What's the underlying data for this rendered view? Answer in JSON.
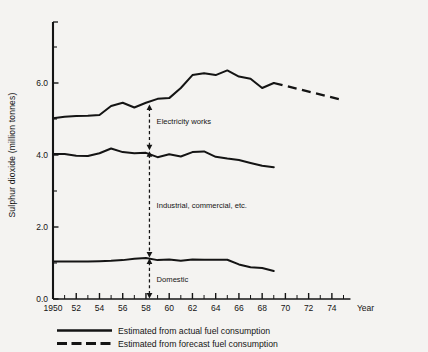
{
  "chart_data": {
    "type": "line",
    "title": "",
    "xlabel": "Year",
    "ylabel": "Sulphur dioxide (million tonnes)",
    "xlim": [
      1950,
      1975
    ],
    "ylim": [
      0.0,
      7.4
    ],
    "grid": false,
    "legend_position": "below-plot",
    "x_tick_labels": [
      "1950",
      "52",
      "54",
      "56",
      "58",
      "60",
      "62",
      "64",
      "66",
      "68",
      "70",
      "72",
      "74"
    ],
    "x_tick_values": [
      1950,
      1952,
      1954,
      1956,
      1958,
      1960,
      1962,
      1964,
      1966,
      1968,
      1970,
      1972,
      1974
    ],
    "x_minor_interval": 1,
    "y_tick_labels": [
      "0.0",
      "2.0",
      "4.0",
      "6.0"
    ],
    "y_tick_values": [
      0.0,
      2.0,
      4.0,
      6.0
    ],
    "y_minor_ticks": [
      1.0,
      3.0,
      5.0,
      7.0
    ],
    "x": [
      1950,
      1951,
      1952,
      1953,
      1954,
      1955,
      1956,
      1957,
      1958,
      1959,
      1960,
      1961,
      1962,
      1963,
      1964,
      1965,
      1966,
      1967,
      1968,
      1969
    ],
    "series": [
      {
        "name": "Electricity works",
        "style": "solid",
        "label": "Electricity works",
        "values": [
          5.02,
          5.06,
          5.08,
          5.09,
          5.11,
          5.36,
          5.45,
          5.32,
          5.45,
          5.56,
          5.58,
          5.86,
          6.22,
          6.27,
          6.22,
          6.35,
          6.18,
          6.12,
          5.86,
          6.0
        ]
      },
      {
        "name": "Industrial, commercial, etc.",
        "style": "solid",
        "label": "Industrial, commercial, etc.",
        "values": [
          4.03,
          4.03,
          3.98,
          3.97,
          4.05,
          4.18,
          4.08,
          4.05,
          4.06,
          3.94,
          4.02,
          3.96,
          4.08,
          4.1,
          3.95,
          3.9,
          3.86,
          3.78,
          3.7,
          3.66
        ]
      },
      {
        "name": "Domestic",
        "style": "solid",
        "label": "Domestic",
        "values": [
          1.04,
          1.04,
          1.04,
          1.04,
          1.05,
          1.06,
          1.08,
          1.12,
          1.14,
          1.08,
          1.1,
          1.06,
          1.1,
          1.09,
          1.09,
          1.09,
          0.96,
          0.88,
          0.86,
          0.78
        ]
      }
    ],
    "forecast": {
      "name": "Electricity works forecast",
      "style": "dashed",
      "x": [
        1969,
        1975
      ],
      "values": [
        6.0,
        5.52
      ]
    },
    "annotations": [
      {
        "text": "Electricity works",
        "x": 1958.4,
        "y": 4.95
      },
      {
        "text": "Industrial, commercial, etc.",
        "x": 1958.4,
        "y": 2.6
      },
      {
        "text": "Domestic",
        "x": 1958.4,
        "y": 0.55
      }
    ],
    "arrows": [
      {
        "x": 1958.3,
        "y_top": 5.42,
        "y_bottom": 4.12,
        "label": "Electricity works"
      },
      {
        "x": 1958.3,
        "y_top": 4.12,
        "y_bottom": 1.14,
        "label": "Industrial, commercial, etc."
      },
      {
        "x": 1958.3,
        "y_top": 1.14,
        "y_bottom": 0.0,
        "label": "Domestic"
      }
    ],
    "legend": [
      {
        "label": "Estimated from actual fuel consumption",
        "style": "solid"
      },
      {
        "label": "Estimated from forecast fuel consumption",
        "style": "dashed"
      }
    ]
  },
  "axis": {
    "year_label": "Year"
  },
  "colors": {
    "ink": "#141414",
    "background": "#f4f3f1"
  }
}
